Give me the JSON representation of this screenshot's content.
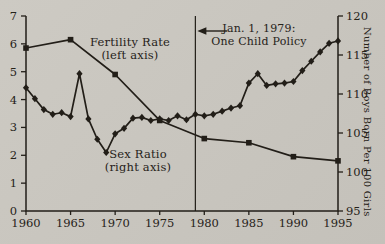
{
  "figure": {
    "background": "#c8c5be",
    "ink": "#221e18"
  },
  "labels": {
    "fertility_line1": "Fertility Rate",
    "fertility_line2": "(left axis)",
    "sex_ratio_line1": "Sex Ratio",
    "sex_ratio_line2": "(right axis)",
    "right_axis": "Number of Boys Born Per 100 Girls"
  },
  "chart_data": {
    "type": "line",
    "grid": false,
    "legend": "inline-labels",
    "x_axis": {
      "range": [
        1960,
        1995
      ],
      "ticks": [
        1960,
        1965,
        1970,
        1975,
        1980,
        1985,
        1990,
        1995
      ]
    },
    "left_axis": {
      "label": "Fertility Rate (left axis)",
      "range": [
        0,
        7
      ],
      "ticks": [
        0,
        1,
        2,
        3,
        4,
        5,
        6,
        7
      ]
    },
    "right_axis": {
      "label": "Number of Boys Born Per 100 Girls",
      "range": [
        95,
        120
      ],
      "ticks": [
        95,
        100,
        105,
        110,
        115,
        120
      ]
    },
    "event_line": {
      "year": 1979,
      "label_line1": "Jan. 1, 1979:",
      "label_line2": "One Child Policy"
    },
    "series": [
      {
        "name": "Fertility Rate",
        "axis": "left",
        "marker": "square",
        "x": [
          1960,
          1965,
          1970,
          1975,
          1980,
          1985,
          1990,
          1995
        ],
        "values": [
          5.85,
          6.15,
          4.9,
          3.25,
          2.6,
          2.45,
          1.95,
          1.8
        ]
      },
      {
        "name": "Sex Ratio",
        "axis": "right",
        "marker": "diamond",
        "x": [
          1960,
          1961,
          1962,
          1963,
          1964,
          1965,
          1966,
          1967,
          1968,
          1969,
          1970,
          1971,
          1972,
          1973,
          1974,
          1975,
          1976,
          1977,
          1978,
          1979,
          1980,
          1981,
          1982,
          1983,
          1984,
          1985,
          1986,
          1987,
          1988,
          1989,
          1990,
          1991,
          1992,
          1993,
          1994,
          1995
        ],
        "values": [
          110.8,
          109.4,
          108.0,
          107.4,
          107.6,
          107.1,
          112.6,
          106.8,
          104.2,
          102.5,
          104.9,
          105.6,
          106.9,
          107.0,
          106.6,
          106.8,
          106.6,
          107.2,
          106.7,
          107.4,
          107.2,
          107.4,
          107.8,
          108.2,
          108.5,
          111.4,
          112.6,
          111.1,
          111.3,
          111.4,
          111.6,
          113.0,
          114.2,
          115.4,
          116.5,
          116.8
        ]
      }
    ]
  }
}
